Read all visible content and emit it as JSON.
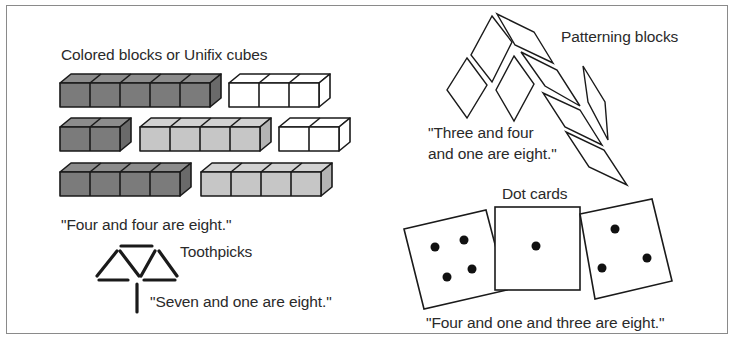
{
  "figure": {
    "sections": {
      "blocks": {
        "title": "Colored blocks or Unifix cubes",
        "caption": "\"Four and four are eight.\"",
        "rows": [
          [
            {
              "count": 5,
              "color": "dark"
            },
            {
              "count": 3,
              "color": "white"
            }
          ],
          [
            {
              "count": 2,
              "color": "dark"
            },
            {
              "count": 4,
              "color": "light"
            },
            {
              "count": 2,
              "color": "white"
            }
          ],
          [
            {
              "count": 4,
              "color": "dark"
            },
            {
              "count": 4,
              "color": "light"
            }
          ]
        ]
      },
      "toothpicks": {
        "title": "Toothpicks",
        "caption": "\"Seven and one are eight.\"",
        "count": 8
      },
      "patterning_blocks": {
        "title": "Patterning blocks",
        "caption_line1": "\"Three and four",
        "caption_line2": "and one are eight.\"",
        "groups": [
          3,
          4,
          1
        ]
      },
      "dot_cards": {
        "title": "Dot cards",
        "caption": "\"Four and one and three are eight.\"",
        "cards": [
          4,
          1,
          3
        ]
      }
    },
    "colors": {
      "dark_front": "#7b7b7b",
      "dark_top": "#8c8c8c",
      "dark_side": "#6a6a6a",
      "light_front": "#c6c6c6",
      "light_top": "#d2d2d2",
      "light_side": "#b4b4b4",
      "white": "#ffffff",
      "stroke": "#1a1a1a",
      "frame": "#8a8a8a"
    }
  }
}
